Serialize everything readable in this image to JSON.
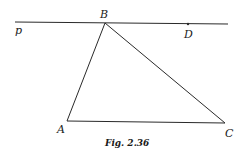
{
  "figure": {
    "caption": "Fig. 2.36",
    "colors": {
      "stroke": "#2a2a2a",
      "text": "#1a1a1a",
      "background": "#ffffff"
    },
    "line_p": {
      "label": "p",
      "x1": 15,
      "y1": 22,
      "x2": 228,
      "y2": 24
    },
    "points": {
      "A": {
        "label": "A",
        "x": 67,
        "y": 121
      },
      "B": {
        "label": "B",
        "x": 105,
        "y": 23
      },
      "C": {
        "label": "C",
        "x": 225,
        "y": 123
      },
      "D": {
        "label": "D",
        "x": 188,
        "y": 24
      }
    },
    "segments": [
      "AB",
      "BC",
      "AC"
    ]
  }
}
